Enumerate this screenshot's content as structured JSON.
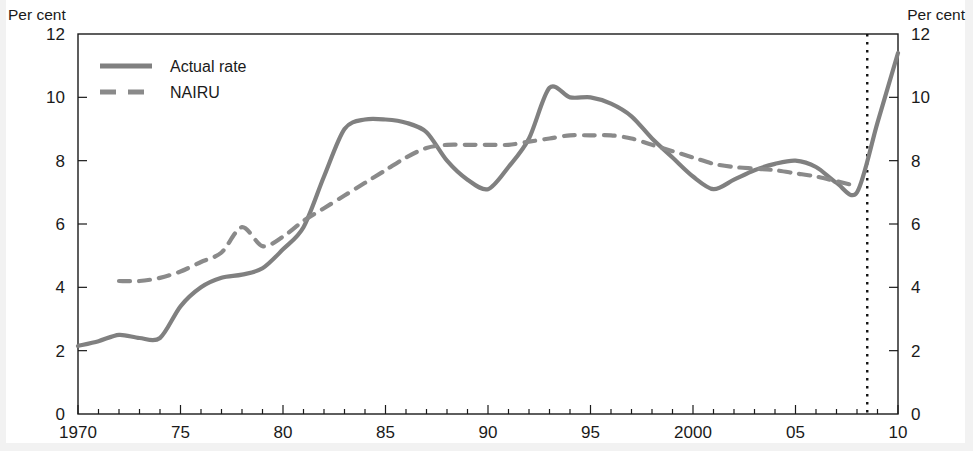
{
  "figure": {
    "unit_label_left": "Per cent",
    "unit_label_right": "Per cent"
  },
  "chart_data": {
    "type": "line",
    "title": "",
    "xlabel": "",
    "ylabel": "Per cent",
    "y2label": "Per cent",
    "xlim": [
      1970,
      2010
    ],
    "ylim": [
      0,
      12
    ],
    "yticks": [
      0,
      2,
      4,
      6,
      8,
      10,
      12
    ],
    "ytick_labels": [
      "0",
      "2",
      "4",
      "6",
      "8",
      "10",
      "12"
    ],
    "xticks": [
      1970,
      1975,
      1980,
      1985,
      1990,
      1995,
      2000,
      2005,
      2010
    ],
    "xtick_labels": [
      "1970",
      "75",
      "80",
      "85",
      "90",
      "95",
      "2000",
      "05",
      "10"
    ],
    "minor_xtick_interval": 1,
    "grid": false,
    "legend_position": "top-left",
    "annotations": [
      {
        "type": "vertical-dotted-line",
        "name": "forecast-divider",
        "x": 2008.5,
        "style": "dotted",
        "color": "#111111"
      }
    ],
    "series": [
      {
        "name": "Actual rate",
        "style": "solid",
        "color": "#808080",
        "x": [
          1970,
          1971,
          1972,
          1973,
          1974,
          1975,
          1976,
          1977,
          1978,
          1979,
          1980,
          1981,
          1982,
          1983,
          1984,
          1985,
          1986,
          1987,
          1988,
          1989,
          1990,
          1991,
          1992,
          1993,
          1994,
          1995,
          1996,
          1997,
          1998,
          1999,
          2000,
          2001,
          2002,
          2003,
          2004,
          2005,
          2006,
          2007,
          2008,
          2009,
          2010
        ],
        "values": [
          2.15,
          2.3,
          2.5,
          2.4,
          2.4,
          3.4,
          4.0,
          4.3,
          4.4,
          4.6,
          5.2,
          5.9,
          7.5,
          9.0,
          9.3,
          9.3,
          9.2,
          8.9,
          8.0,
          7.4,
          7.1,
          7.8,
          8.7,
          10.3,
          10.0,
          10.0,
          9.8,
          9.4,
          8.7,
          8.1,
          7.5,
          7.1,
          7.4,
          7.7,
          7.9,
          8.0,
          7.8,
          7.3,
          7.0,
          9.2,
          11.4
        ]
      },
      {
        "name": "NAIRU",
        "style": "dashed",
        "color": "#8a8a8a",
        "x": [
          1972,
          1973,
          1974,
          1975,
          1976,
          1977,
          1978,
          1979,
          1980,
          1981,
          1982,
          1983,
          1984,
          1985,
          1986,
          1987,
          1988,
          1989,
          1990,
          1991,
          1992,
          1993,
          1994,
          1995,
          1996,
          1997,
          1998,
          1999,
          2000,
          2001,
          2002,
          2003,
          2004,
          2005,
          2006,
          2007,
          2008
        ],
        "values": [
          4.2,
          4.2,
          4.3,
          4.5,
          4.8,
          5.1,
          5.9,
          5.3,
          5.6,
          6.1,
          6.5,
          6.9,
          7.3,
          7.7,
          8.1,
          8.4,
          8.5,
          8.5,
          8.5,
          8.5,
          8.6,
          8.7,
          8.8,
          8.8,
          8.8,
          8.7,
          8.5,
          8.3,
          8.1,
          7.9,
          7.8,
          7.75,
          7.7,
          7.6,
          7.5,
          7.35,
          7.2
        ]
      }
    ]
  },
  "legend": {
    "items": [
      {
        "label": "Actual rate",
        "style": "solid",
        "color": "#808080"
      },
      {
        "label": "NAIRU",
        "style": "dashed",
        "color": "#8a8a8a"
      }
    ]
  }
}
